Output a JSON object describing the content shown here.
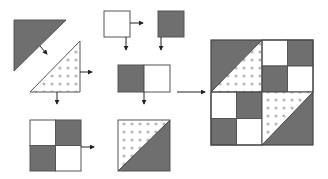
{
  "diagram": {
    "colors": {
      "dark": "#6f6f6f",
      "light": "#ffffff",
      "outline": "#555555",
      "dot": "#b8b8b8",
      "arrow": "#222222"
    },
    "pieces": [
      {
        "id": "dark-triangle",
        "kind": "triangle",
        "fill": "dark"
      },
      {
        "id": "dotted-triangle",
        "kind": "triangle",
        "fill": "dotted"
      },
      {
        "id": "white-square",
        "kind": "square",
        "fill": "light"
      },
      {
        "id": "dark-square",
        "kind": "square",
        "fill": "dark"
      },
      {
        "id": "two-patch-unit",
        "kind": "rectangle",
        "fills": [
          "dark",
          "light"
        ]
      },
      {
        "id": "four-patch-unit",
        "kind": "square",
        "grid": [
          [
            "light",
            "dark"
          ],
          [
            "dark",
            "light"
          ]
        ]
      },
      {
        "id": "half-square-triangle-unit",
        "kind": "square",
        "fills": [
          "dotted",
          "dark"
        ]
      },
      {
        "id": "finished-block",
        "kind": "square",
        "layout": [
          [
            "hst-upper",
            "hst-upper",
            "light",
            "dark"
          ],
          [
            "hst-upper",
            "hst-upper",
            "dark",
            "light"
          ],
          [
            "light",
            "dark",
            "hst-lower",
            "hst-lower"
          ],
          [
            "dark",
            "light",
            "hst-lower",
            "hst-lower"
          ]
        ]
      }
    ],
    "steps": [
      {
        "from": "dark-triangle",
        "to": "dotted-triangle",
        "meaning": "join triangles"
      },
      {
        "from": "dotted-triangle",
        "to": "half-square-triangle-unit"
      },
      {
        "from": "white-square",
        "to": "two-patch-unit"
      },
      {
        "from": "dark-square",
        "to": "two-patch-unit"
      },
      {
        "from": "two-patch-unit",
        "to": "four-patch-unit"
      },
      {
        "from": "four-patch-unit",
        "to": "half-square-triangle-unit"
      },
      {
        "from": "two-patch-unit",
        "to": "finished-block"
      }
    ]
  }
}
